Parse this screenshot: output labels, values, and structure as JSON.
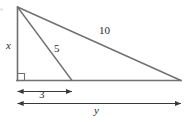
{
  "figure": {
    "kind": "geometry-diagram",
    "colors": {
      "background": "#ffffff",
      "stroke": "#707070",
      "arrow": "#3a3a3a",
      "label_text": "#2a2a2a"
    },
    "stroke_width": 1.4,
    "points": {
      "apex": {
        "x": 17,
        "y": 7
      },
      "base_left": {
        "x": 17,
        "y": 80
      },
      "base_right": {
        "x": 181,
        "y": 80
      },
      "cevian_foot": {
        "x": 72,
        "y": 80
      }
    },
    "right_angle_marker": {
      "at": {
        "x": 17,
        "y": 80
      },
      "size": 7
    },
    "segments": [
      {
        "name": "vertical-leg",
        "label": "x",
        "from": "apex",
        "to": "base_left"
      },
      {
        "name": "cevian",
        "label": "5",
        "from": "apex",
        "to": "cevian_foot"
      },
      {
        "name": "hypotenuse",
        "label": "10",
        "from": "apex",
        "to": "base_right"
      },
      {
        "name": "base",
        "label": "y",
        "from": "base_left",
        "to": "base_right"
      }
    ],
    "dimension_arrows": [
      {
        "name": "dim-3",
        "label": "3",
        "y": 91,
        "x_start": 17,
        "x_end": 72
      },
      {
        "name": "dim-y",
        "label": "y",
        "y": 103,
        "x_start": 17,
        "x_end": 181
      }
    ],
    "labels": {
      "leg_x": "x",
      "cevian_5": "5",
      "hypotenuse_10": "10",
      "base_segment_3": "3",
      "base_total_y": "y"
    }
  }
}
